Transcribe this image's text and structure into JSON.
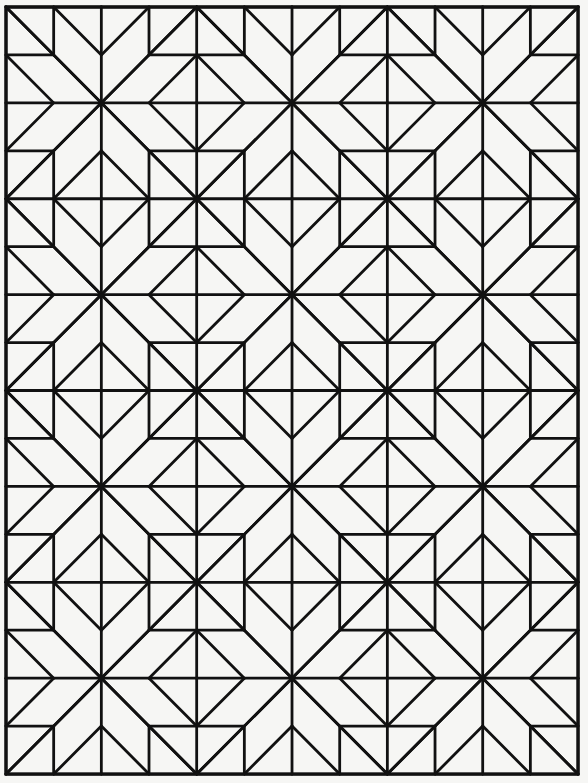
{
  "canvas": {
    "width": 588,
    "height": 783,
    "background": "#f6f6f4"
  },
  "style": {
    "stroke": "#111111",
    "stroke_width": 2.8,
    "fill": "none"
  },
  "grid": {
    "cols": 12,
    "rows": 16,
    "origin_x": 6,
    "origin_y": 7,
    "cell_w": 47.67,
    "cell_h": 47.94
  },
  "motif_lattice": {
    "star_centers_rule": "x = 2 + 4a, y = 2 + 4b",
    "square_centers_rule": "x = 4a, y = 4b",
    "star_centers": [
      [
        2,
        2
      ],
      [
        6,
        2
      ],
      [
        10,
        2
      ],
      [
        2,
        6
      ],
      [
        6,
        6
      ],
      [
        10,
        6
      ],
      [
        2,
        10
      ],
      [
        6,
        10
      ],
      [
        10,
        10
      ],
      [
        2,
        14
      ],
      [
        6,
        14
      ],
      [
        10,
        14
      ]
    ],
    "square_centers": [
      [
        0,
        0
      ],
      [
        4,
        0
      ],
      [
        8,
        0
      ],
      [
        12,
        0
      ],
      [
        0,
        4
      ],
      [
        4,
        4
      ],
      [
        8,
        4
      ],
      [
        12,
        4
      ],
      [
        0,
        8
      ],
      [
        4,
        8
      ],
      [
        8,
        8
      ],
      [
        12,
        8
      ],
      [
        0,
        12
      ],
      [
        4,
        12
      ],
      [
        8,
        12
      ],
      [
        12,
        12
      ],
      [
        0,
        16
      ],
      [
        4,
        16
      ],
      [
        8,
        16
      ],
      [
        12,
        16
      ]
    ]
  },
  "motifs": {
    "radiating": [
      [
        -2,
        0,
        2,
        0
      ],
      [
        0,
        -2,
        0,
        2
      ],
      [
        -2,
        -2,
        2,
        2
      ],
      [
        2,
        -2,
        -2,
        2
      ]
    ],
    "chevrons": [
      [
        -1,
        -2,
        0,
        -1
      ],
      [
        0,
        -1,
        1,
        -2
      ],
      [
        -1,
        2,
        0,
        1
      ],
      [
        0,
        1,
        1,
        2
      ],
      [
        -2,
        -1,
        -1,
        0
      ],
      [
        -1,
        0,
        -2,
        1
      ],
      [
        2,
        -1,
        1,
        0
      ],
      [
        1,
        0,
        2,
        1
      ]
    ],
    "square_outline": [
      [
        -1,
        -1,
        1,
        -1
      ],
      [
        1,
        -1,
        1,
        1
      ],
      [
        1,
        1,
        -1,
        1
      ],
      [
        -1,
        1,
        -1,
        -1
      ]
    ]
  },
  "summary": {
    "star_count": 12,
    "square_count": 20,
    "diamond_count": 18
  }
}
